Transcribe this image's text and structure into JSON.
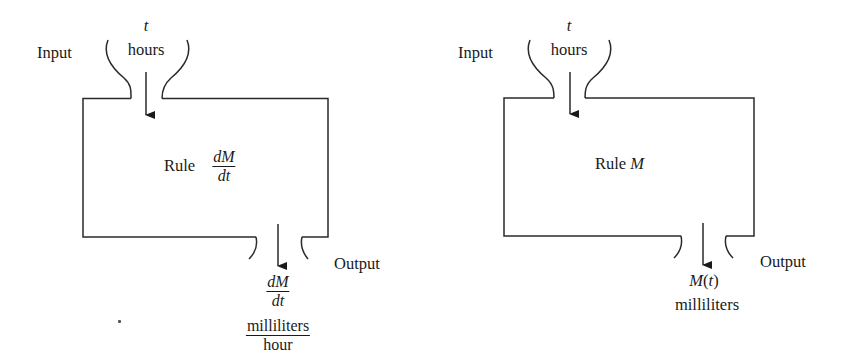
{
  "diagrams": [
    {
      "id": "derivative-machine",
      "input": {
        "label": "Input",
        "variable": "t",
        "unit": "hours"
      },
      "rule": {
        "prefix": "Rule",
        "numerator": "dM",
        "denominator": "dt"
      },
      "output": {
        "label": "Output",
        "value_numerator": "dM",
        "value_denominator": "dt",
        "unit_numerator": "milliliters",
        "unit_denominator": "hour"
      }
    },
    {
      "id": "function-machine",
      "input": {
        "label": "Input",
        "variable": "t",
        "unit": "hours"
      },
      "rule": {
        "prefix": "Rule",
        "name": "M"
      },
      "output": {
        "label": "Output",
        "value": "M(t)",
        "value_name": "M",
        "value_open": "(",
        "value_arg": "t",
        "value_close": ")",
        "unit": "milliliters"
      }
    }
  ],
  "colors": {
    "line": "#2a2a2a",
    "text": "#1a1a1a",
    "background": "#ffffff"
  }
}
